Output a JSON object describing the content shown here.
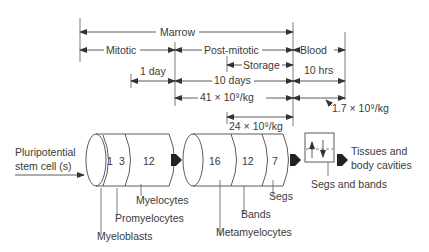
{
  "timeline": {
    "marrow": "Marrow",
    "mitotic": "Mitotic",
    "post_mitotic": "Post-mitotic",
    "blood": "Blood",
    "storage": "Storage",
    "one_day": "1 day",
    "ten_days": "10 days",
    "ten_hrs": "10 hrs",
    "pool_41": "41 × 10⁹/kg",
    "pool_24": "24 × 10⁹/kg",
    "pool_1_7": "1.7 × 10⁹/kg"
  },
  "input": {
    "line1": "Pluripotential",
    "line2": "stem cell (s)"
  },
  "mitotic_cylinder": {
    "segments": [
      {
        "value": "1",
        "label": "Myeloblasts"
      },
      {
        "value": "3",
        "label": "Promyelocytes"
      },
      {
        "value": "12",
        "label": "Myelocytes"
      }
    ]
  },
  "postmitotic_cylinder": {
    "segments": [
      {
        "value": "16",
        "label": "Metamyelocytes"
      },
      {
        "value": "12",
        "label": "Bands"
      },
      {
        "value": "7",
        "label": "Segs"
      }
    ]
  },
  "blood_box": {
    "label": "Segs and bands"
  },
  "output": {
    "line1": "Tissues and",
    "line2": "body cavities"
  }
}
